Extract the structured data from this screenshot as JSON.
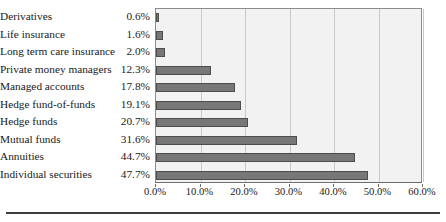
{
  "chart_data": {
    "type": "bar",
    "orientation": "horizontal",
    "title": "",
    "xlabel": "",
    "ylabel": "",
    "categories": [
      "Derivatives",
      "Life insurance",
      "Long term care insurance",
      "Private money managers",
      "Managed accounts",
      "Hedge fund-of-funds",
      "Hedge funds",
      "Mutual funds",
      "Annuities",
      "Individual securities"
    ],
    "values": [
      0.6,
      1.6,
      2.0,
      12.3,
      17.8,
      19.1,
      20.7,
      31.6,
      44.7,
      47.7
    ],
    "value_labels": [
      "0.6%",
      "1.6%",
      "2.0%",
      "12.3%",
      "17.8%",
      "19.1%",
      "20.7%",
      "31.6%",
      "44.7%",
      "47.7%"
    ],
    "xlim": [
      0,
      60
    ],
    "xticks": [
      0,
      10,
      20,
      30,
      40,
      50,
      60
    ],
    "xtick_labels": [
      "0.0%",
      "10.0%",
      "20.0%",
      "30.0%",
      "40.0%",
      "50.0%",
      "60.0%"
    ],
    "grid": true,
    "grid_axis": "x",
    "legend": false,
    "colors": {
      "bar_fill": "#777777",
      "bar_stroke": "#4d4d4d",
      "plot_background": "#f2f2f2",
      "plot_border": "#8c8c8c",
      "gridline": "#c9c9c9",
      "text": "#1a1a1a",
      "rule": "#3d3d3d"
    }
  }
}
